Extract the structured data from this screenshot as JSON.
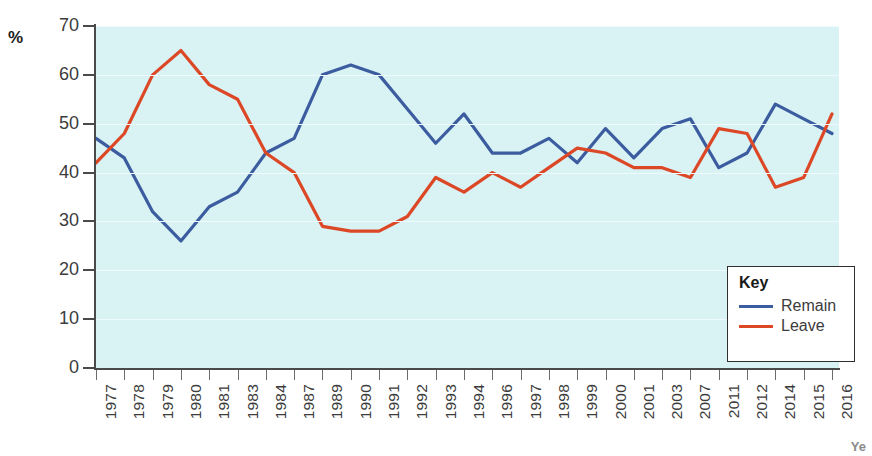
{
  "axis": {
    "unit_label": "%",
    "y_ticks": [
      0,
      10,
      20,
      30,
      40,
      50,
      60,
      70
    ]
  },
  "legend": {
    "title": "Key",
    "items": [
      {
        "label": "Remain",
        "color": "#3c5ca0"
      },
      {
        "label": "Leave",
        "color": "#dc4726"
      }
    ]
  },
  "corner_mark": "Ye",
  "colors": {
    "plot_background": "#d9f2f4",
    "gridline": "#eefafb",
    "axis": "#4a4a4a",
    "tick_text": "#3c3c3c",
    "remain": "#3c5ca0",
    "leave": "#dc4726"
  },
  "chart_data": {
    "type": "line",
    "title": "",
    "xlabel": "Year",
    "ylabel": "%",
    "ylim": [
      0,
      70
    ],
    "ytick_step": 10,
    "grid": true,
    "legend_position": "bottom-right",
    "categories": [
      "1977",
      "1978",
      "1979",
      "1980",
      "1981",
      "1983",
      "1984",
      "1987",
      "1989",
      "1990",
      "1991",
      "1992",
      "1993",
      "1994",
      "1996",
      "1997",
      "1998",
      "1999",
      "2000",
      "2001",
      "2003",
      "2007",
      "2011",
      "2012",
      "2014",
      "2015",
      "2016"
    ],
    "series": [
      {
        "name": "Remain",
        "color": "#3c5ca0",
        "values": [
          47,
          43,
          32,
          26,
          33,
          36,
          44,
          47,
          60,
          62,
          60,
          53,
          46,
          52,
          44,
          44,
          47,
          42,
          49,
          43,
          49,
          51,
          41,
          44,
          54,
          51,
          48
        ]
      },
      {
        "name": "Leave",
        "color": "#dc4726",
        "values": [
          42,
          48,
          60,
          65,
          58,
          55,
          44,
          40,
          29,
          28,
          28,
          31,
          39,
          36,
          40,
          37,
          41,
          45,
          44,
          41,
          41,
          39,
          49,
          48,
          37,
          39,
          52
        ]
      }
    ]
  }
}
